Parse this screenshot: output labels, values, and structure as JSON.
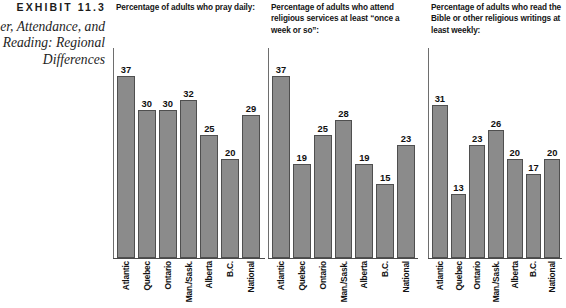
{
  "exhibit": {
    "label": "EXHIBIT 11.3",
    "caption_lines": [
      "er, Attendance, and",
      "Reading: Regional",
      "Differences"
    ]
  },
  "chart_data": [
    {
      "type": "bar",
      "title": "Percentage of adults who pray daily:",
      "categories": [
        "Atlantic",
        "Quebec",
        "Ontario",
        "Man./Sask.",
        "Alberta",
        "B.C.",
        "National"
      ],
      "values": [
        37,
        30,
        30,
        32,
        25,
        20,
        29
      ],
      "xlabel": "",
      "ylabel": "",
      "ylim": [
        0,
        40
      ],
      "grid": false,
      "legend": "none",
      "bar_color": "#8b8b8b",
      "bar_edge_color": "#4f4f4f"
    },
    {
      "type": "bar",
      "title": "Percentage of adults who attend religious services at least “once a week or so”:",
      "categories": [
        "Atlantic",
        "Quebec",
        "Ontario",
        "Man./Sask.",
        "Alberta",
        "B.C.",
        "National"
      ],
      "values": [
        37,
        19,
        25,
        28,
        19,
        15,
        23
      ],
      "xlabel": "",
      "ylabel": "",
      "ylim": [
        0,
        40
      ],
      "grid": false,
      "legend": "none",
      "bar_color": "#8b8b8b",
      "bar_edge_color": "#4f4f4f"
    },
    {
      "type": "bar",
      "title": "Percentage of adults who read the Bible or other religious writings at least weekly:",
      "categories": [
        "Atlantic",
        "Quebec",
        "Ontario",
        "Man./Sask.",
        "Alberta",
        "B.C.",
        "National"
      ],
      "values": [
        31,
        13,
        23,
        26,
        20,
        17,
        20
      ],
      "xlabel": "",
      "ylabel": "",
      "ylim": [
        0,
        40
      ],
      "grid": false,
      "legend": "none",
      "bar_color": "#8b8b8b",
      "bar_edge_color": "#4f4f4f"
    }
  ],
  "panels": [
    {
      "title_lines": [
        "Percentage of adults who pray daily:"
      ]
    },
    {
      "title_lines": [
        "Percentage of adults who attend",
        "religious services at least “once a",
        "week or so”:"
      ]
    },
    {
      "title_lines": [
        "Percentage of adults who read the",
        "Bible or other religious writings at",
        "least weekly:"
      ]
    }
  ]
}
